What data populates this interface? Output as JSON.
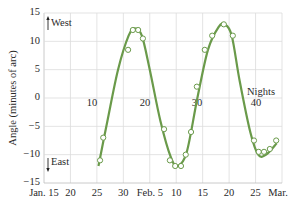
{
  "chart_data": {
    "type": "line",
    "title": "",
    "xlabel": "",
    "ylabel": "Angle (minutes of arc)",
    "ylim": [
      -15,
      15
    ],
    "xlim_days_from_jan15": [
      0,
      45
    ],
    "grid": true,
    "legend": null,
    "x_tick_labels": [
      "Jan. 15",
      "20",
      "25",
      "30",
      "Feb. 5",
      "10",
      "15",
      "20",
      "25",
      "Mar. 1"
    ],
    "y_tick_labels": [
      "15",
      "10",
      "5",
      "0",
      "-5",
      "-10",
      "-15"
    ],
    "y_ticks": [
      15,
      10,
      5,
      0,
      -5,
      -10,
      -15
    ],
    "secondary_axis": {
      "label": "Nights",
      "ticks": [
        10,
        20,
        30,
        40
      ],
      "tick_labels": [
        "10",
        "20",
        "30",
        "40"
      ]
    },
    "annotations": [
      {
        "text": "West",
        "direction": "up",
        "y": 13
      },
      {
        "text": "East",
        "direction": "down",
        "y": -12
      }
    ],
    "series": [
      {
        "name": "observations",
        "kind": "scatter",
        "marker": "open-circle",
        "color": "#6a9a4a",
        "x": [
          10.6,
          11.2,
          15.9,
          16.8,
          17.8,
          18.7,
          22.7,
          23.8,
          24.8,
          25.9,
          26.8,
          27.8,
          28.9,
          30.4,
          31.8,
          34.0,
          35.7,
          39.7,
          40.6,
          41.6,
          42.7,
          43.9
        ],
        "y": [
          -11,
          -7,
          8.5,
          12,
          12,
          10.5,
          -5.5,
          -11,
          -12,
          -12,
          -10,
          -6,
          2,
          8.5,
          11,
          13,
          11,
          -7.5,
          -9.5,
          -9.5,
          -9,
          -7.5
        ]
      },
      {
        "name": "fit",
        "kind": "line",
        "color": "#6a9a4a",
        "x": [
          10.3,
          12,
          14,
          16,
          17.2,
          18.5,
          20,
          22,
          24,
          25.3,
          27,
          29,
          31,
          33,
          34.2,
          35.5,
          37,
          39,
          40.5,
          42,
          44
        ],
        "y": [
          -12,
          -4,
          5,
          11,
          12.3,
          11,
          5,
          -4,
          -10.5,
          -12,
          -9.5,
          0,
          8.5,
          12.5,
          13,
          11,
          3,
          -6,
          -10,
          -10,
          -8
        ]
      }
    ]
  },
  "labels": {
    "ylabel": "Angle (minutes of arc)",
    "west": "West",
    "east": "East",
    "nights": "Nights"
  }
}
